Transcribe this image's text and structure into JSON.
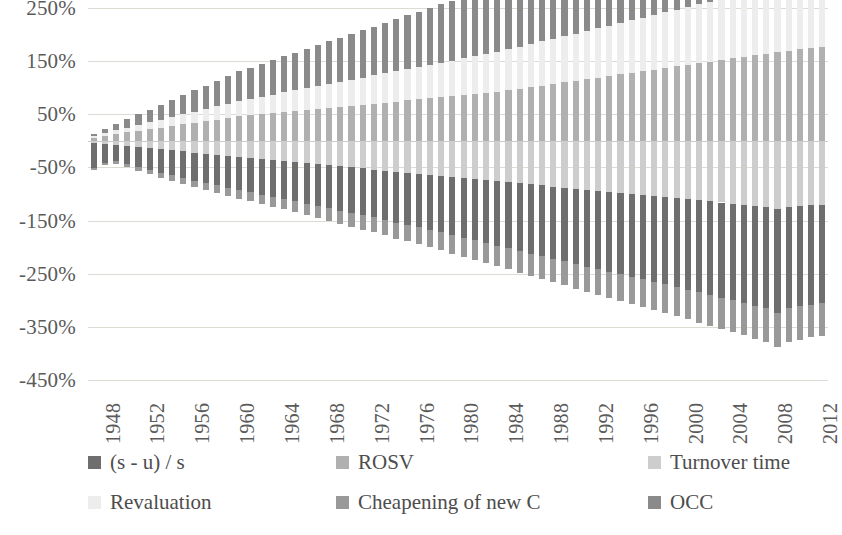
{
  "chart_data": {
    "type": "bar",
    "stacked": true,
    "title": "",
    "subtitle": "",
    "xlabel": "",
    "ylabel": "",
    "grid": true,
    "legend_position": "bottom",
    "ylim": [
      -450,
      250
    ],
    "ytick_step": 100,
    "ytick_labels": [
      "250%",
      "150%",
      "50%",
      "-50%",
      "-150%",
      "-250%",
      "-350%",
      "-450%"
    ],
    "ytick_values": [
      250,
      150,
      50,
      -50,
      -150,
      -250,
      -350,
      -450
    ],
    "xtick_labels": [
      "1948",
      "1952",
      "1956",
      "1960",
      "1964",
      "1968",
      "1972",
      "1976",
      "1980",
      "1984",
      "1988",
      "1992",
      "1996",
      "2000",
      "2004",
      "2008",
      "2012"
    ],
    "xtick_step": 4,
    "x": [
      1948,
      1949,
      1950,
      1951,
      1952,
      1953,
      1954,
      1955,
      1956,
      1957,
      1958,
      1959,
      1960,
      1961,
      1962,
      1963,
      1964,
      1965,
      1966,
      1967,
      1968,
      1969,
      1970,
      1971,
      1972,
      1973,
      1974,
      1975,
      1976,
      1977,
      1978,
      1979,
      1980,
      1981,
      1982,
      1983,
      1984,
      1985,
      1986,
      1987,
      1988,
      1989,
      1990,
      1991,
      1992,
      1993,
      1994,
      1995,
      1996,
      1997,
      1998,
      1999,
      2000,
      2001,
      2002,
      2003,
      2004,
      2005,
      2006,
      2007,
      2008,
      2009,
      2010,
      2011,
      2012,
      2013
    ],
    "colors": {
      "s_minus_u_over_s": "#6e6e6e",
      "rosv": "#b0b0b0",
      "turnover_time": "#cdcdcd",
      "revaluation": "#ededed",
      "cheapening_of_new_c": "#999999",
      "occ": "#8a8a8a"
    },
    "series": [
      {
        "name": "(s - u) / s",
        "key": "s_minus_u_over_s",
        "color": "#6e6e6e",
        "values": [
          -48,
          -36,
          -30,
          -34,
          -38,
          -41,
          -44,
          -47,
          -50,
          -53,
          -56,
          -58,
          -60,
          -63,
          -65,
          -67,
          -69,
          -71,
          -73,
          -76,
          -78,
          -81,
          -84,
          -86,
          -88,
          -90,
          -93,
          -96,
          -98,
          -100,
          -103,
          -106,
          -109,
          -112,
          -115,
          -118,
          -121,
          -124,
          -127,
          -130,
          -133,
          -136,
          -139,
          -142,
          -145,
          -148,
          -150,
          -153,
          -156,
          -158,
          -161,
          -164,
          -167,
          -170,
          -173,
          -176,
          -179,
          -182,
          -185,
          -188,
          -191,
          -195,
          -190,
          -188,
          -187,
          -186
        ]
      },
      {
        "name": "ROSV",
        "key": "rosv",
        "color": "#b0b0b0",
        "values": [
          6,
          10,
          13,
          16,
          19,
          22,
          25,
          28,
          31,
          34,
          37,
          40,
          43,
          46,
          48,
          50,
          52,
          54,
          56,
          58,
          60,
          62,
          64,
          66,
          68,
          70,
          72,
          74,
          76,
          78,
          80,
          82,
          84,
          86,
          88,
          90,
          92,
          95,
          98,
          101,
          104,
          107,
          110,
          113,
          116,
          119,
          122,
          125,
          128,
          131,
          134,
          137,
          140,
          143,
          146,
          149,
          152,
          155,
          158,
          161,
          164,
          168,
          170,
          172,
          174,
          176
        ]
      },
      {
        "name": "Turnover time",
        "key": "turnover_time",
        "color": "#cdcdcd",
        "values": [
          -4,
          -6,
          -8,
          -10,
          -12,
          -14,
          -16,
          -18,
          -20,
          -22,
          -24,
          -26,
          -28,
          -30,
          -32,
          -34,
          -36,
          -38,
          -40,
          -42,
          -44,
          -46,
          -48,
          -50,
          -52,
          -54,
          -56,
          -58,
          -60,
          -62,
          -64,
          -66,
          -68,
          -70,
          -72,
          -74,
          -76,
          -78,
          -80,
          -82,
          -84,
          -86,
          -88,
          -90,
          -92,
          -94,
          -96,
          -98,
          -100,
          -102,
          -104,
          -106,
          -108,
          -110,
          -112,
          -114,
          -116,
          -118,
          -120,
          -122,
          -124,
          -128,
          -125,
          -123,
          -121,
          -120
        ]
      },
      {
        "name": "Revaluation",
        "key": "revaluation",
        "color": "#ededed",
        "values": [
          3,
          5,
          7,
          9,
          11,
          13,
          15,
          17,
          19,
          21,
          23,
          25,
          27,
          29,
          31,
          33,
          35,
          37,
          39,
          41,
          43,
          45,
          47,
          49,
          51,
          53,
          55,
          57,
          59,
          61,
          63,
          65,
          67,
          69,
          71,
          73,
          75,
          77,
          79,
          81,
          83,
          85,
          87,
          89,
          91,
          93,
          95,
          97,
          99,
          101,
          103,
          105,
          107,
          109,
          111,
          113,
          115,
          117,
          119,
          121,
          123,
          126,
          128,
          130,
          132,
          134
        ]
      },
      {
        "name": "Cheapening of new C",
        "key": "cheapening_of_new_c",
        "color": "#999999",
        "values": [
          -3,
          -4,
          -5,
          -6,
          -7,
          -8,
          -9,
          -10,
          -11,
          -12,
          -13,
          -14,
          -15,
          -16,
          -17,
          -18,
          -19,
          -20,
          -21,
          -22,
          -23,
          -24,
          -25,
          -26,
          -27,
          -28,
          -29,
          -30,
          -31,
          -32,
          -33,
          -34,
          -35,
          -36,
          -37,
          -38,
          -39,
          -40,
          -41,
          -42,
          -43,
          -44,
          -45,
          -46,
          -47,
          -48,
          -49,
          -50,
          -51,
          -52,
          -53,
          -54,
          -55,
          -56,
          -57,
          -58,
          -59,
          -60,
          -61,
          -62,
          -63,
          -65,
          -64,
          -63,
          -62,
          -61
        ]
      },
      {
        "name": "OCC",
        "key": "occ",
        "color": "#8a8a8a",
        "values": [
          4,
          8,
          12,
          16,
          20,
          24,
          28,
          32,
          36,
          40,
          44,
          48,
          52,
          56,
          59,
          62,
          65,
          68,
          71,
          74,
          77,
          80,
          83,
          86,
          89,
          92,
          95,
          98,
          101,
          104,
          107,
          110,
          113,
          116,
          119,
          122,
          125,
          128,
          131,
          134,
          137,
          140,
          143,
          146,
          149,
          152,
          155,
          158,
          161,
          164,
          167,
          170,
          173,
          176,
          179,
          182,
          185,
          188,
          191,
          194,
          197,
          201,
          204,
          207,
          210,
          213
        ]
      }
    ]
  },
  "legend": {
    "items": [
      {
        "label": "(s - u) / s",
        "color": "#6e6e6e",
        "name": "legend-item-s-minus-u-over-s"
      },
      {
        "label": "ROSV",
        "color": "#b0b0b0",
        "name": "legend-item-rosv"
      },
      {
        "label": "Turnover time",
        "color": "#cdcdcd",
        "name": "legend-item-turnover-time"
      },
      {
        "label": "Revaluation",
        "color": "#ededed",
        "name": "legend-item-revaluation"
      },
      {
        "label": "Cheapening of new C",
        "color": "#999999",
        "name": "legend-item-cheapening-of-new-c"
      },
      {
        "label": "OCC",
        "color": "#8a8a8a",
        "name": "legend-item-occ"
      }
    ]
  }
}
